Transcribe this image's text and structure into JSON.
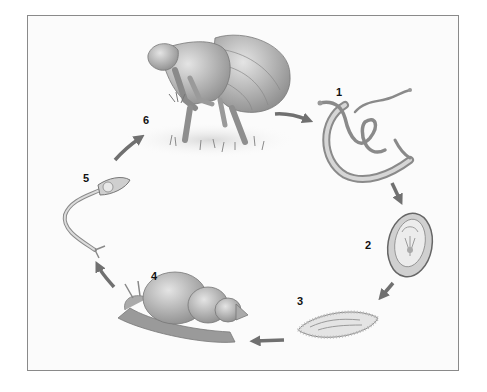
{
  "diagram": {
    "type": "life-cycle",
    "stages": [
      {
        "number": "1",
        "name": "adult-worms"
      },
      {
        "number": "2",
        "name": "egg"
      },
      {
        "number": "3",
        "name": "miracidium"
      },
      {
        "number": "4",
        "name": "snail-host"
      },
      {
        "number": "5",
        "name": "cercaria"
      },
      {
        "number": "6",
        "name": "human-host-in-water"
      }
    ],
    "colors": {
      "arrow": "#707070",
      "frame": "#8a8a8a",
      "label": "#111111"
    }
  }
}
